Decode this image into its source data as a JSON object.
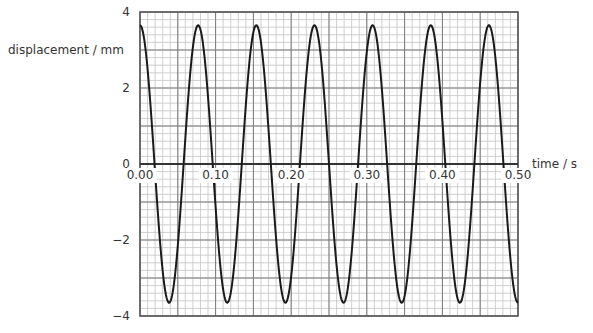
{
  "chart_data": {
    "type": "line",
    "title": "",
    "xlabel": "time / s",
    "ylabel": "displacement / mm",
    "xlim": [
      0,
      0.5
    ],
    "ylim": [
      -4,
      4
    ],
    "x_ticks": [
      0.0,
      0.1,
      0.2,
      0.3,
      0.4,
      0.5
    ],
    "x_tick_labels": [
      "0.00",
      "0.10",
      "0.20",
      "0.30",
      "0.40",
      "0.50"
    ],
    "y_ticks": [
      4,
      2,
      0,
      -2,
      -4
    ],
    "y_tick_labels": [
      "4",
      "2",
      "0",
      "−2",
      "−4"
    ],
    "grid": {
      "on": true,
      "major_x_step": 0.05,
      "minor_x_step": 0.01,
      "major_y_step": 1,
      "minor_y_step": 0.2
    },
    "series": [
      {
        "name": "displacement",
        "function": "y = 3.65 * cos(2*pi*13*t)",
        "amplitude_mm": 3.65,
        "frequency_hz": 13,
        "period_s": 0.077,
        "x": [
          0.0,
          0.0385,
          0.0769,
          0.1154,
          0.1538,
          0.1923,
          0.2308,
          0.2692,
          0.3077,
          0.3462,
          0.3846,
          0.4231,
          0.4615,
          0.5
        ],
        "values": [
          3.65,
          -3.65,
          3.65,
          -3.65,
          3.65,
          -3.65,
          3.65,
          -3.65,
          3.65,
          -3.65,
          3.65,
          -3.65,
          3.65,
          -3.65
        ]
      }
    ],
    "legend": null
  },
  "colors": {
    "curve": "#1a1a1a",
    "major_grid": "#7a7a7a",
    "minor_grid": "#c4c4c4",
    "axis": "#333333",
    "text": "#333333"
  }
}
